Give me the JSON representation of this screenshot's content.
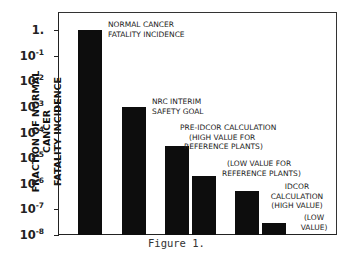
{
  "chart_data": {
    "type": "bar",
    "title": "",
    "caption": "Figure 1.",
    "xlabel": "",
    "ylabel": "FRACTION OF NORMAL CANCER FATALITY INCIDENCE",
    "yscale": "log",
    "ylim": [
      1e-08,
      1
    ],
    "ytick_labels": [
      "1.",
      "10-1",
      "10-2",
      "10-3",
      "10-4",
      "10-5",
      "10-6",
      "10-7",
      "10-8"
    ],
    "categories": [
      "NORMAL CANCER FATALITY INCIDENCE",
      "NRC INTERIM SAFETY GOAL",
      "PRE-IDCOR CALCULATION (HIGH VALUE FOR REFERENCE PLANTS)",
      "(LOW VALUE FOR REFERENCE PLANTS)",
      "IDCOR CALCULATION (HIGH VALUE)",
      "(LOW VALUE)"
    ],
    "values": [
      1,
      0.001,
      3e-05,
      2e-06,
      5e-07,
      3e-08
    ],
    "grid": false,
    "legend": null
  },
  "axis": {
    "ylabel_line1": "FRACTION OF NORMAL CANCER",
    "ylabel_line2": "FATALITY INCIDENCE",
    "ticks": [
      {
        "base": "1.",
        "exp": ""
      },
      {
        "base": "10",
        "exp": "-1"
      },
      {
        "base": "10",
        "exp": "-2"
      },
      {
        "base": "10",
        "exp": "-3"
      },
      {
        "base": "10",
        "exp": "-4"
      },
      {
        "base": "10",
        "exp": "-5"
      },
      {
        "base": "10",
        "exp": "-6"
      },
      {
        "base": "10",
        "exp": "-7"
      },
      {
        "base": "10",
        "exp": "-8"
      }
    ]
  },
  "annotations": {
    "a1_l1": "NORMAL CANCER",
    "a1_l2": "FATALITY INCIDENCE",
    "a2_l1": "NRC INTERIM",
    "a2_l2": "SAFETY GOAL",
    "a3_l1": "PRE-IDCOR CALCULATION",
    "a3_l2": "(HIGH VALUE FOR",
    "a3_l3": "REFERENCE PLANTS)",
    "a4_l1": "(LOW VALUE FOR",
    "a4_l2": "REFERENCE PLANTS)",
    "a5_l1": "IDCOR",
    "a5_l2": "CALCULATION",
    "a5_l3": "(HIGH VALUE)",
    "a6_l1": "(LOW",
    "a6_l2": "VALUE)"
  },
  "caption": "Figure 1."
}
